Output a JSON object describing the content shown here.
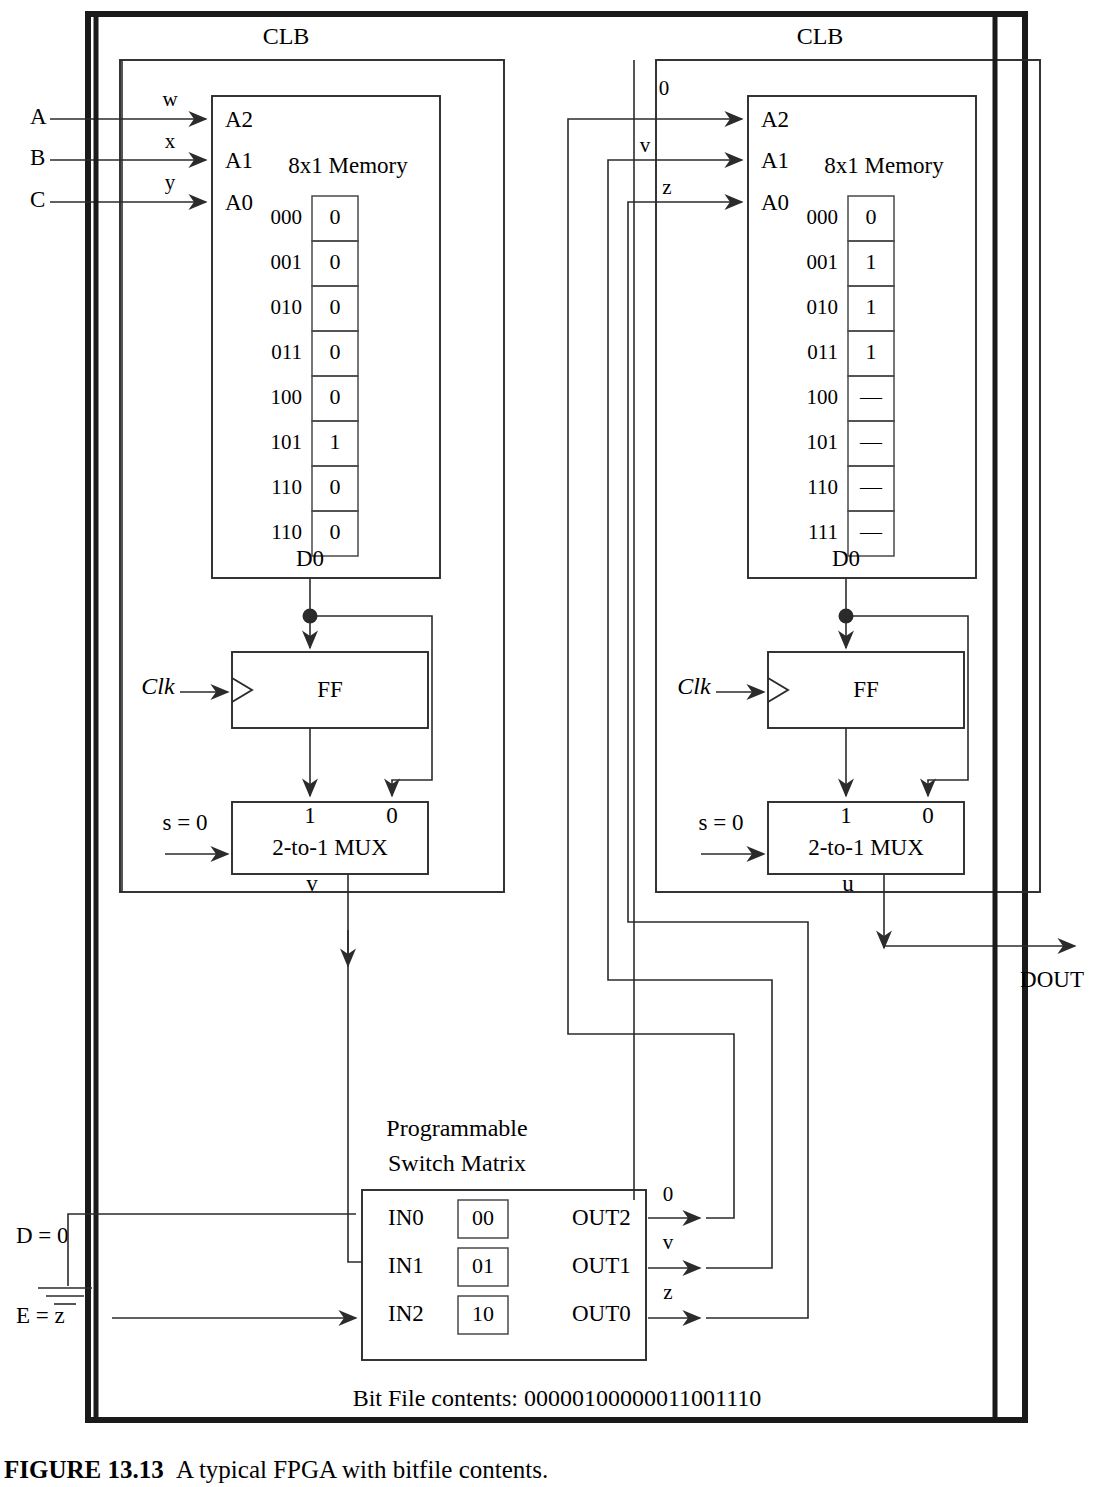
{
  "figure": {
    "caption_label": "FIGURE 13.13",
    "caption_text": "A typical FPGA with bitfile contents.",
    "bitfile_text": "Bit File contents: 00000100000011001110",
    "dout_label": "DOUT"
  },
  "external_inputs": [
    {
      "name": "A",
      "label": "A",
      "route_label": "w"
    },
    {
      "name": "B",
      "label": "B",
      "route_label": "x"
    },
    {
      "name": "C",
      "label": "C",
      "route_label": "y"
    }
  ],
  "bottom_inputs": [
    {
      "name": "D",
      "label": "D = 0",
      "icon": "ground-icon"
    },
    {
      "name": "E",
      "label": "E = z"
    }
  ],
  "clb_left": {
    "title": "CLB",
    "memory_title": "8x1 Memory",
    "address_pins": [
      "A2",
      "A1",
      "A0"
    ],
    "data_out_pin": "D0",
    "memory_rows": [
      {
        "address": "000",
        "value": "0"
      },
      {
        "address": "001",
        "value": "0"
      },
      {
        "address": "010",
        "value": "0"
      },
      {
        "address": "011",
        "value": "0"
      },
      {
        "address": "100",
        "value": "0"
      },
      {
        "address": "101",
        "value": "1"
      },
      {
        "address": "110",
        "value": "0"
      },
      {
        "address": "110",
        "value": "0"
      }
    ],
    "ff_label": "FF",
    "clk_label": "Clk",
    "mux_label": "2-to-1 MUX",
    "mux_input_1": "1",
    "mux_input_0": "0",
    "mux_select_label": "s = 0",
    "mux_output_label": "v"
  },
  "clb_right": {
    "title": "CLB",
    "memory_title": "8x1 Memory",
    "address_pins": [
      "A2",
      "A1",
      "A0"
    ],
    "address_pin_signals": [
      "0",
      "v",
      "z"
    ],
    "data_out_pin": "D0",
    "memory_rows": [
      {
        "address": "000",
        "value": "0"
      },
      {
        "address": "001",
        "value": "1"
      },
      {
        "address": "010",
        "value": "1"
      },
      {
        "address": "011",
        "value": "1"
      },
      {
        "address": "100",
        "value": "—"
      },
      {
        "address": "101",
        "value": "—"
      },
      {
        "address": "110",
        "value": "—"
      },
      {
        "address": "111",
        "value": "—"
      }
    ],
    "ff_label": "FF",
    "clk_label": "Clk",
    "mux_label": "2-to-1 MUX",
    "mux_input_1": "1",
    "mux_input_0": "0",
    "mux_select_label": "s = 0",
    "mux_output_label": "u"
  },
  "switch_matrix": {
    "title_line1": "Programmable",
    "title_line2": "Switch Matrix",
    "inputs": [
      {
        "pin": "IN0",
        "config": "00"
      },
      {
        "pin": "IN1",
        "config": "01"
      },
      {
        "pin": "IN2",
        "config": "10"
      }
    ],
    "outputs": [
      {
        "pin": "OUT2",
        "signal": "0"
      },
      {
        "pin": "OUT1",
        "signal": "v"
      },
      {
        "pin": "OUT0",
        "signal": "z"
      }
    ]
  },
  "colors": {
    "line": "#2b2b2b",
    "border": "#1a1a1a",
    "background": "#ffffff"
  }
}
